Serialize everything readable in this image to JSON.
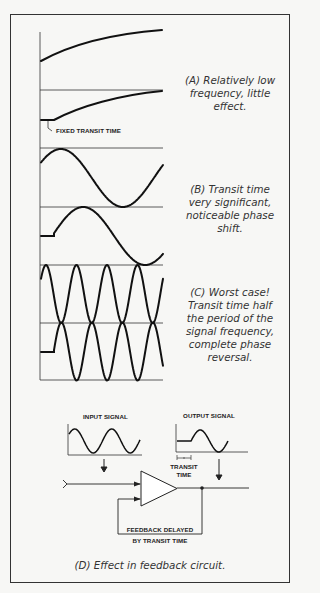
{
  "figure": {
    "panels": [
      {
        "id": "A",
        "caption": "(A)  Relatively low frequency, little effect.",
        "caption_lines": [
          "(A)  Relatively low",
          "frequency, little",
          "effect."
        ]
      },
      {
        "id": "B",
        "caption": "(B)  Transit time very significant, noticeable phase shift.",
        "caption_lines": [
          "(B)  Transit time",
          "very significant,",
          "noticeable phase",
          "shift."
        ]
      },
      {
        "id": "C",
        "caption": "(C)  Worst case! Transit time half the period of the signal frequency, complete phase reversal.",
        "caption_lines": [
          "(C)  Worst case!",
          "Transit time half",
          "the period of the",
          "signal frequency,",
          "complete phase",
          "reversal."
        ]
      },
      {
        "id": "D",
        "caption": "(D)  Effect in feedback circuit."
      }
    ],
    "labels": {
      "fixed_transit_time": "FIXED TRANSIT TIME",
      "input_signal": "INPUT SIGNAL",
      "output_signal": "OUTPUT SIGNAL",
      "transit": "TRANSIT",
      "time": "TIME",
      "feedback_line1": "FEEDBACK DELAYED",
      "feedback_line2": "BY TRANSIT TIME"
    }
  }
}
